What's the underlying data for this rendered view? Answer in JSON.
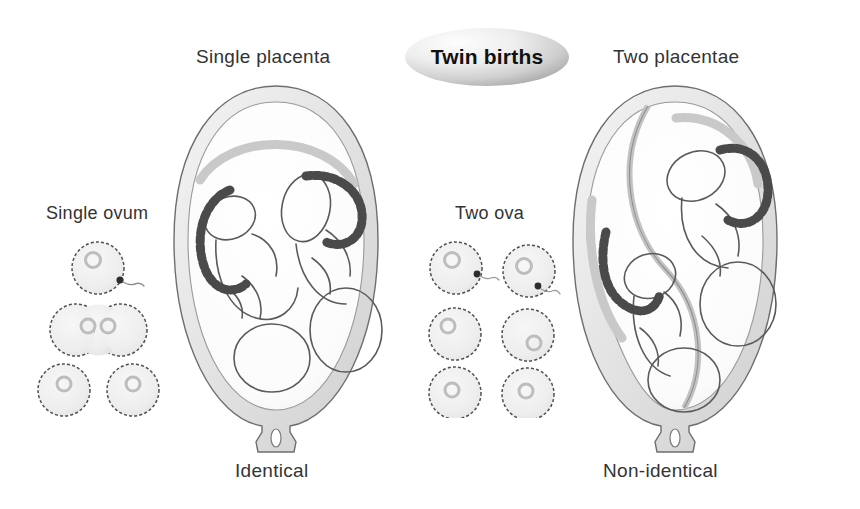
{
  "diagram": {
    "title": "Twin births",
    "background_color": "#ffffff",
    "text_color": "#333333",
    "title_text_color": "#111111",
    "ellipse_color_light": "#f2f2f2",
    "ellipse_color_dark": "#a8a8a8",
    "cell_fill_color": "#efefef",
    "cell_stroke_color": "#555555",
    "uterus_wall_color": "#dcdcdc",
    "uterus_inner_color": "#fbfbfb",
    "cord_color": "#4a4a4a",
    "fetus_line_color": "#555555"
  },
  "labels": {
    "single_placenta": "Single placenta",
    "two_placentae": "Two placentae",
    "single_ovum": "Single ovum",
    "two_ova": "Two ova",
    "identical": "Identical",
    "non_identical": "Non-identical"
  },
  "left_panel": {
    "heading": "Single placenta",
    "ovum_heading": "Single ovum",
    "outcome": "Identical",
    "ova_count": 1,
    "sperm_count": 1,
    "placenta_count": 1,
    "amniotic_sacs": 1,
    "fetus_count": 2,
    "stages": [
      {
        "name": "fertilised-ovum",
        "cells": 1,
        "has_sperm": true
      },
      {
        "name": "dividing-zygote",
        "cells": 2,
        "has_sperm": false
      },
      {
        "name": "separated-cells",
        "cells": 2,
        "has_sperm": false
      }
    ]
  },
  "right_panel": {
    "heading": "Two placentae",
    "ovum_heading": "Two ova",
    "outcome": "Non-identical",
    "ova_count": 2,
    "sperm_count": 2,
    "placenta_count": 2,
    "amniotic_sacs": 2,
    "fetus_count": 2,
    "stages": [
      {
        "name": "two-fertilised-ova",
        "cells": 2,
        "has_sperm": true
      },
      {
        "name": "two-zygotes",
        "cells": 2,
        "has_sperm": false
      },
      {
        "name": "two-embryos",
        "cells": 2,
        "has_sperm": false
      }
    ]
  }
}
